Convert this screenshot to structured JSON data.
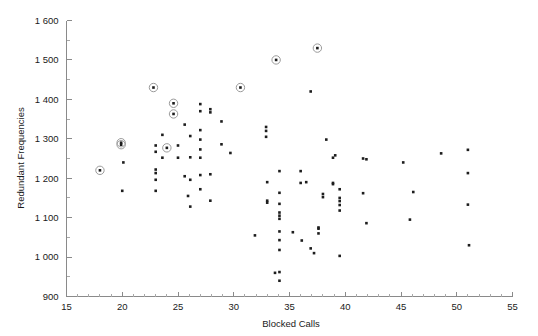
{
  "chart_data": {
    "type": "scatter",
    "title": "",
    "xlabel": "Blocked Calls",
    "ylabel": "Redundant Frequencies",
    "xlim": [
      15,
      55
    ],
    "ylim": [
      900,
      1600
    ],
    "xticks": [
      15,
      20,
      25,
      30,
      35,
      40,
      45,
      50,
      55
    ],
    "xtick_labels": [
      "15",
      "20",
      "25",
      "30",
      "35",
      "40",
      "45",
      "50",
      "55"
    ],
    "yticks": [
      900,
      1000,
      1100,
      1200,
      1300,
      1400,
      1500,
      1600
    ],
    "ytick_labels": [
      "900",
      "1 000",
      "1 100",
      "1 200",
      "1 300",
      "1 400",
      "1 500",
      "1 600"
    ],
    "x_minor_step": 1,
    "y_minor_step": 50,
    "grid": false,
    "legend": null,
    "marker_color": "#1d1d1d",
    "highlight_ring_color": "#9a9a9a",
    "axis_color": "#8a8a8a",
    "points": [
      {
        "x": 18.0,
        "y": 1220,
        "highlighted": true
      },
      {
        "x": 19.9,
        "y": 1285,
        "highlighted": true
      },
      {
        "x": 19.9,
        "y": 1290,
        "highlighted": true
      },
      {
        "x": 20.1,
        "y": 1240,
        "highlighted": false
      },
      {
        "x": 20.0,
        "y": 1168,
        "highlighted": false
      },
      {
        "x": 22.8,
        "y": 1430,
        "highlighted": true
      },
      {
        "x": 23.0,
        "y": 1283,
        "highlighted": false
      },
      {
        "x": 23.0,
        "y": 1267,
        "highlighted": false
      },
      {
        "x": 23.0,
        "y": 1222,
        "highlighted": false
      },
      {
        "x": 23.0,
        "y": 1213,
        "highlighted": false
      },
      {
        "x": 23.0,
        "y": 1196,
        "highlighted": false
      },
      {
        "x": 23.0,
        "y": 1168,
        "highlighted": false
      },
      {
        "x": 23.6,
        "y": 1310,
        "highlighted": false
      },
      {
        "x": 23.6,
        "y": 1252,
        "highlighted": false
      },
      {
        "x": 24.0,
        "y": 1277,
        "highlighted": true
      },
      {
        "x": 24.6,
        "y": 1390,
        "highlighted": true
      },
      {
        "x": 24.6,
        "y": 1363,
        "highlighted": true
      },
      {
        "x": 25.0,
        "y": 1283,
        "highlighted": false
      },
      {
        "x": 25.0,
        "y": 1252,
        "highlighted": false
      },
      {
        "x": 25.6,
        "y": 1336,
        "highlighted": false
      },
      {
        "x": 25.6,
        "y": 1205,
        "highlighted": false
      },
      {
        "x": 25.9,
        "y": 1155,
        "highlighted": false
      },
      {
        "x": 26.1,
        "y": 1307,
        "highlighted": false
      },
      {
        "x": 26.1,
        "y": 1253,
        "highlighted": false
      },
      {
        "x": 26.1,
        "y": 1196,
        "highlighted": false
      },
      {
        "x": 26.1,
        "y": 1128,
        "highlighted": false
      },
      {
        "x": 27.0,
        "y": 1388,
        "highlighted": false
      },
      {
        "x": 27.0,
        "y": 1370,
        "highlighted": false
      },
      {
        "x": 27.0,
        "y": 1322,
        "highlighted": false
      },
      {
        "x": 27.0,
        "y": 1298,
        "highlighted": false
      },
      {
        "x": 27.0,
        "y": 1273,
        "highlighted": false
      },
      {
        "x": 27.0,
        "y": 1252,
        "highlighted": false
      },
      {
        "x": 27.0,
        "y": 1208,
        "highlighted": false
      },
      {
        "x": 27.0,
        "y": 1172,
        "highlighted": false
      },
      {
        "x": 27.9,
        "y": 1375,
        "highlighted": false
      },
      {
        "x": 27.9,
        "y": 1367,
        "highlighted": false
      },
      {
        "x": 27.9,
        "y": 1210,
        "highlighted": false
      },
      {
        "x": 27.9,
        "y": 1143,
        "highlighted": false
      },
      {
        "x": 28.9,
        "y": 1344,
        "highlighted": false
      },
      {
        "x": 28.9,
        "y": 1286,
        "highlighted": false
      },
      {
        "x": 29.7,
        "y": 1264,
        "highlighted": false
      },
      {
        "x": 30.6,
        "y": 1430,
        "highlighted": true
      },
      {
        "x": 31.9,
        "y": 1055,
        "highlighted": false
      },
      {
        "x": 32.9,
        "y": 1330,
        "highlighted": false
      },
      {
        "x": 32.9,
        "y": 1320,
        "highlighted": false
      },
      {
        "x": 32.9,
        "y": 1305,
        "highlighted": false
      },
      {
        "x": 33.0,
        "y": 1190,
        "highlighted": false
      },
      {
        "x": 33.0,
        "y": 1143,
        "highlighted": false
      },
      {
        "x": 33.0,
        "y": 1138,
        "highlighted": false
      },
      {
        "x": 33.8,
        "y": 1500,
        "highlighted": true
      },
      {
        "x": 34.1,
        "y": 1218,
        "highlighted": false
      },
      {
        "x": 34.1,
        "y": 1163,
        "highlighted": false
      },
      {
        "x": 34.1,
        "y": 1135,
        "highlighted": false
      },
      {
        "x": 34.1,
        "y": 1113,
        "highlighted": false
      },
      {
        "x": 34.1,
        "y": 1105,
        "highlighted": false
      },
      {
        "x": 34.1,
        "y": 1097,
        "highlighted": false
      },
      {
        "x": 34.1,
        "y": 1065,
        "highlighted": false
      },
      {
        "x": 34.1,
        "y": 1043,
        "highlighted": false
      },
      {
        "x": 34.1,
        "y": 1018,
        "highlighted": false
      },
      {
        "x": 34.1,
        "y": 962,
        "highlighted": false
      },
      {
        "x": 34.1,
        "y": 940,
        "highlighted": false
      },
      {
        "x": 33.7,
        "y": 960,
        "highlighted": false
      },
      {
        "x": 35.3,
        "y": 1063,
        "highlighted": false
      },
      {
        "x": 36.0,
        "y": 1218,
        "highlighted": false
      },
      {
        "x": 36.0,
        "y": 1188,
        "highlighted": false
      },
      {
        "x": 36.1,
        "y": 1042,
        "highlighted": false
      },
      {
        "x": 36.5,
        "y": 1190,
        "highlighted": false
      },
      {
        "x": 36.9,
        "y": 1420,
        "highlighted": false
      },
      {
        "x": 36.9,
        "y": 1022,
        "highlighted": false
      },
      {
        "x": 37.2,
        "y": 1010,
        "highlighted": false
      },
      {
        "x": 37.5,
        "y": 1530,
        "highlighted": true
      },
      {
        "x": 37.6,
        "y": 1075,
        "highlighted": false
      },
      {
        "x": 37.6,
        "y": 1072,
        "highlighted": false
      },
      {
        "x": 37.6,
        "y": 1060,
        "highlighted": false
      },
      {
        "x": 38.0,
        "y": 1160,
        "highlighted": false
      },
      {
        "x": 38.0,
        "y": 1152,
        "highlighted": false
      },
      {
        "x": 38.3,
        "y": 1298,
        "highlighted": false
      },
      {
        "x": 38.9,
        "y": 1252,
        "highlighted": false
      },
      {
        "x": 38.9,
        "y": 1188,
        "highlighted": false
      },
      {
        "x": 38.9,
        "y": 1185,
        "highlighted": false
      },
      {
        "x": 39.1,
        "y": 1258,
        "highlighted": false
      },
      {
        "x": 39.5,
        "y": 1172,
        "highlighted": false
      },
      {
        "x": 39.5,
        "y": 1150,
        "highlighted": false
      },
      {
        "x": 39.5,
        "y": 1142,
        "highlighted": false
      },
      {
        "x": 39.5,
        "y": 1132,
        "highlighted": false
      },
      {
        "x": 39.5,
        "y": 1118,
        "highlighted": false
      },
      {
        "x": 39.5,
        "y": 1003,
        "highlighted": false
      },
      {
        "x": 41.6,
        "y": 1250,
        "highlighted": false
      },
      {
        "x": 41.6,
        "y": 1162,
        "highlighted": false
      },
      {
        "x": 41.9,
        "y": 1248,
        "highlighted": false
      },
      {
        "x": 41.9,
        "y": 1086,
        "highlighted": false
      },
      {
        "x": 45.2,
        "y": 1240,
        "highlighted": false
      },
      {
        "x": 45.8,
        "y": 1095,
        "highlighted": false
      },
      {
        "x": 46.1,
        "y": 1165,
        "highlighted": false
      },
      {
        "x": 48.6,
        "y": 1263,
        "highlighted": false
      },
      {
        "x": 51.0,
        "y": 1272,
        "highlighted": false
      },
      {
        "x": 51.0,
        "y": 1213,
        "highlighted": false
      },
      {
        "x": 51.0,
        "y": 1133,
        "highlighted": false
      },
      {
        "x": 51.1,
        "y": 1030,
        "highlighted": false
      }
    ]
  }
}
